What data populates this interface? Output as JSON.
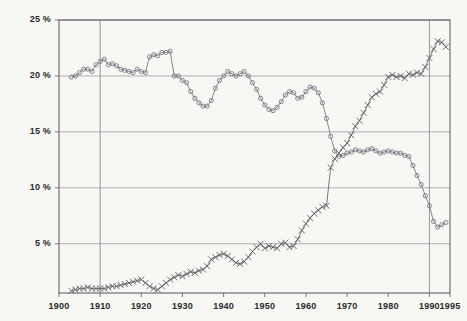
{
  "chart_data": {
    "type": "line",
    "title": "",
    "subtitle": "",
    "xlabel": "",
    "ylabel": "",
    "xlim": [
      1900,
      1995
    ],
    "ylim": [
      0.6,
      25
    ],
    "grid": true,
    "grid_axes": "horizontal-and-two-vertical",
    "legend": "none",
    "y_ticks": [
      25,
      20,
      15,
      10,
      5
    ],
    "y_ticklabels": [
      "25 %",
      "20 %",
      "15 %",
      "10 %",
      "5 %"
    ],
    "x_ticks": [
      1900,
      1910,
      1920,
      1930,
      1940,
      1950,
      1960,
      1970,
      1980,
      1990,
      1995
    ],
    "x_ticklabels": [
      "1900",
      "1910",
      "1920",
      "1930",
      "1940",
      "1950",
      "1960",
      "1970",
      "1980",
      "1990",
      "1995"
    ],
    "x_gridlines": [
      1910,
      1990
    ],
    "series": [
      {
        "name": "declining-series",
        "marker": "circle",
        "color": "#6b6b78",
        "x": [
          1903,
          1904,
          1905,
          1906,
          1907,
          1908,
          1909,
          1910,
          1911,
          1912,
          1913,
          1914,
          1915,
          1916,
          1917,
          1918,
          1919,
          1920,
          1921,
          1922,
          1923,
          1924,
          1925,
          1926,
          1927,
          1928,
          1929,
          1930,
          1931,
          1932,
          1933,
          1934,
          1935,
          1936,
          1937,
          1938,
          1939,
          1940,
          1941,
          1942,
          1943,
          1944,
          1945,
          1946,
          1947,
          1948,
          1949,
          1950,
          1951,
          1952,
          1953,
          1954,
          1955,
          1956,
          1957,
          1958,
          1959,
          1960,
          1961,
          1962,
          1963,
          1964,
          1965,
          1966,
          1967,
          1968,
          1969,
          1970,
          1971,
          1972,
          1973,
          1974,
          1975,
          1976,
          1977,
          1978,
          1979,
          1980,
          1981,
          1982,
          1983,
          1984,
          1985,
          1986,
          1987,
          1988,
          1989,
          1990,
          1991,
          1992,
          1993,
          1994
        ],
        "values": [
          19.9,
          20.0,
          20.3,
          20.6,
          20.6,
          20.4,
          21.0,
          21.3,
          21.5,
          21.0,
          21.1,
          20.9,
          20.6,
          20.5,
          20.4,
          20.3,
          20.6,
          20.4,
          20.3,
          21.7,
          21.9,
          21.8,
          22.1,
          22.1,
          22.2,
          20.0,
          20.0,
          19.6,
          19.4,
          18.6,
          18.0,
          17.6,
          17.3,
          17.3,
          17.8,
          18.9,
          19.6,
          20.0,
          20.4,
          20.2,
          20.0,
          20.2,
          20.4,
          20.0,
          19.4,
          18.8,
          18.0,
          17.4,
          17.0,
          16.9,
          17.2,
          17.7,
          18.3,
          18.6,
          18.5,
          18.0,
          18.1,
          18.6,
          19.0,
          18.9,
          18.5,
          17.6,
          16.2,
          14.6,
          13.3,
          12.8,
          12.9,
          13.1,
          13.2,
          13.4,
          13.3,
          13.2,
          13.4,
          13.5,
          13.3,
          13.1,
          13.2,
          13.3,
          13.2,
          13.1,
          13.1,
          12.9,
          12.8,
          12.0,
          11.1,
          10.3,
          9.3,
          8.4,
          7.0,
          6.5,
          6.7,
          6.9
        ]
      },
      {
        "name": "rising-series",
        "marker": "x",
        "color": "#57575f",
        "x": [
          1903,
          1904,
          1905,
          1906,
          1907,
          1908,
          1909,
          1910,
          1911,
          1912,
          1913,
          1914,
          1915,
          1916,
          1917,
          1918,
          1919,
          1920,
          1921,
          1922,
          1923,
          1924,
          1925,
          1926,
          1927,
          1928,
          1929,
          1930,
          1931,
          1932,
          1933,
          1934,
          1935,
          1936,
          1937,
          1938,
          1939,
          1940,
          1941,
          1942,
          1943,
          1944,
          1945,
          1946,
          1947,
          1948,
          1949,
          1950,
          1951,
          1952,
          1953,
          1954,
          1955,
          1956,
          1957,
          1958,
          1959,
          1960,
          1961,
          1962,
          1963,
          1964,
          1965,
          1966,
          1967,
          1968,
          1969,
          1970,
          1971,
          1972,
          1973,
          1974,
          1975,
          1976,
          1977,
          1978,
          1979,
          1980,
          1981,
          1982,
          1983,
          1984,
          1985,
          1986,
          1987,
          1988,
          1989,
          1990,
          1991,
          1992,
          1993,
          1994
        ],
        "values": [
          0.8,
          0.9,
          1.0,
          1.0,
          1.1,
          1.0,
          1.0,
          1.0,
          1.0,
          1.1,
          1.2,
          1.2,
          1.3,
          1.4,
          1.5,
          1.6,
          1.7,
          1.8,
          1.5,
          1.2,
          1.0,
          0.9,
          1.2,
          1.5,
          1.8,
          2.0,
          2.2,
          2.1,
          2.3,
          2.5,
          2.4,
          2.6,
          2.7,
          3.0,
          3.6,
          3.8,
          4.0,
          4.1,
          3.9,
          3.6,
          3.3,
          3.2,
          3.4,
          3.8,
          4.3,
          4.7,
          5.0,
          4.6,
          4.8,
          4.7,
          4.6,
          5.0,
          5.1,
          4.7,
          4.8,
          5.4,
          6.2,
          6.8,
          7.3,
          7.7,
          8.0,
          8.3,
          8.4,
          11.8,
          12.6,
          13.1,
          13.6,
          14.0,
          14.7,
          15.5,
          16.0,
          16.7,
          17.4,
          18.1,
          18.4,
          18.6,
          19.2,
          19.9,
          20.1,
          19.9,
          20.0,
          19.8,
          20.2,
          20.1,
          20.3,
          20.2,
          20.8,
          21.6,
          22.4,
          23.1,
          23.0,
          22.6
        ]
      }
    ]
  }
}
